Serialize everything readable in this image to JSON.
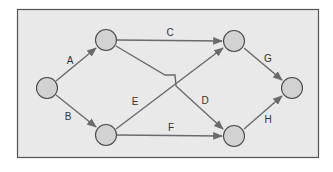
{
  "diagram": {
    "type": "network-activity-on-arrow",
    "colors": {
      "background": "#e9e9e9",
      "border": "#555555",
      "edge": "#6a6a6a",
      "node_fill": "#d2d2d2",
      "node_stroke": "#4a4a4a",
      "label": "#333333"
    },
    "nodes": [
      {
        "id": "n1",
        "x": 47,
        "y": 88
      },
      {
        "id": "n2",
        "x": 106,
        "y": 40
      },
      {
        "id": "n3",
        "x": 106,
        "y": 135
      },
      {
        "id": "n4",
        "x": 234,
        "y": 41
      },
      {
        "id": "n5",
        "x": 234,
        "y": 136
      },
      {
        "id": "n6",
        "x": 292,
        "y": 88
      }
    ],
    "edges": [
      {
        "label": "A",
        "from": "n1",
        "to": "n2"
      },
      {
        "label": "B",
        "from": "n1",
        "to": "n3"
      },
      {
        "label": "C",
        "from": "n2",
        "to": "n4"
      },
      {
        "label": "D",
        "from": "n2",
        "to": "n5"
      },
      {
        "label": "E",
        "from": "n3",
        "to": "n4"
      },
      {
        "label": "F",
        "from": "n3",
        "to": "n5"
      },
      {
        "label": "G",
        "from": "n4",
        "to": "n6"
      },
      {
        "label": "H",
        "from": "n5",
        "to": "n6"
      }
    ],
    "labels": {
      "A": "A",
      "B": "B",
      "C": "C",
      "D": "D",
      "E": "E",
      "F": "F",
      "G": "G",
      "H": "H"
    }
  }
}
